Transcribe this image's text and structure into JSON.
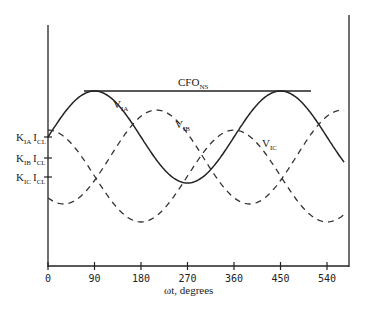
{
  "chart_data": {
    "type": "line",
    "title": "",
    "xlabel": "ωt, degrees",
    "ylabel": "",
    "x_ticks": [
      "0",
      "90",
      "180",
      "270",
      "360",
      "450",
      "540"
    ],
    "xlim": [
      0,
      575
    ],
    "grid": false,
    "series": [
      {
        "name": "V_IA",
        "label": "V",
        "sub": "IA",
        "style": "solid",
        "offset": 0,
        "peak_deg": 90,
        "center_y_px": 137,
        "amplitude_px": 46
      },
      {
        "name": "V_IB",
        "label": "V",
        "sub": "IB",
        "style": "dashed",
        "peak_deg": 210,
        "center_y_px": 157,
        "amplitude_px": 47
      },
      {
        "name": "V_IC",
        "label": "V",
        "sub": "IC",
        "style": "dashed",
        "peak_deg": 0,
        "center_y_px": 176,
        "amplitude_px": 46
      }
    ],
    "reference_line": {
      "name": "CFO_NS",
      "label": "CFO",
      "sub": "NS",
      "x_start_deg": 70,
      "x_end_deg": 505
    },
    "y_tick_labels": [
      {
        "k": "K",
        "ksub": "IA",
        "i": "I",
        "isub": "CL"
      },
      {
        "k": "K",
        "ksub": "IB",
        "i": "I",
        "isub": "CL"
      },
      {
        "k": "K",
        "ksub": "IC",
        "i": "I",
        "isub": "CL"
      }
    ]
  }
}
